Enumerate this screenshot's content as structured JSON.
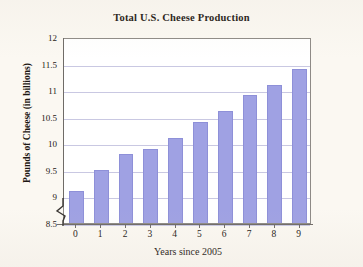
{
  "chart_data": {
    "type": "bar",
    "title": "Total U.S. Cheese Production",
    "xlabel": "Years since 2005",
    "ylabel": "Pounds of Cheese (in billions)",
    "categories": [
      "0",
      "1",
      "2",
      "3",
      "4",
      "5",
      "6",
      "7",
      "8",
      "9"
    ],
    "values": [
      9.1,
      9.5,
      9.8,
      9.9,
      10.1,
      10.4,
      10.6,
      10.9,
      11.1,
      11.4
    ],
    "ylim": [
      8.5,
      12
    ],
    "yticks": [
      "8.5",
      "9",
      "9.5",
      "10",
      "10.5",
      "11",
      "11.5",
      "12"
    ],
    "ytick_values": [
      8.5,
      9,
      9.5,
      10,
      10.5,
      11,
      11.5,
      12
    ],
    "xticks": [
      "0",
      "1",
      "2",
      "3",
      "4",
      "5",
      "6",
      "7",
      "8",
      "9"
    ],
    "grid": "horizontal",
    "legend": "none",
    "axis_break": true,
    "bar_color": "#9fa1e3",
    "grid_color": "#c9c8e2",
    "plot_background": "#ffffff",
    "figure_background": "#faf7f1",
    "axis_color": "#6f6b67"
  }
}
